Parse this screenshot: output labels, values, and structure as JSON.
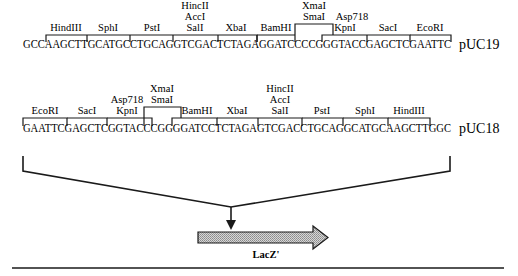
{
  "diagram": {
    "type": "plasmid polylinker / multiple cloning site map",
    "top": {
      "plasmid": "pUC19",
      "sequence": "GCCAAGCTTGCATGCCTGCAGGTCGACTCTAGAGGATCCCCGGGTACCGAGCTCGAATTC",
      "sites": [
        {
          "name": "HindIII"
        },
        {
          "name": "SphI"
        },
        {
          "name": "PstI"
        },
        {
          "name": "HincII / AccI / SalI",
          "lines": [
            "HincII",
            "AccI",
            "SalI"
          ]
        },
        {
          "name": "XbaI"
        },
        {
          "name": "BamHI"
        },
        {
          "name": "XmaI / SmaI",
          "lines": [
            "XmaI",
            "SmaI"
          ]
        },
        {
          "name": "Asp718 / KpnI",
          "lines": [
            "Asp718",
            "KpnI"
          ]
        },
        {
          "name": "SacI"
        },
        {
          "name": "EcoRI"
        }
      ]
    },
    "bottom": {
      "plasmid": "pUC18",
      "sequence": "GAATTCGAGCTCGGTACCCGGGGATCCTCTAGAGTCGACCTGCAGGCATGCAAGCTTGGC",
      "sites": [
        {
          "name": "EcoRI"
        },
        {
          "name": "SacI"
        },
        {
          "name": "Asp718 / KpnI",
          "lines": [
            "Asp718",
            "KpnI"
          ]
        },
        {
          "name": "XmaI / SmaI",
          "lines": [
            "XmaI",
            "SmaI"
          ]
        },
        {
          "name": "BamHI"
        },
        {
          "name": "XbaI"
        },
        {
          "name": "HincII / AccI / SalI",
          "lines": [
            "HincII",
            "AccI",
            "SalI"
          ]
        },
        {
          "name": "PstI"
        },
        {
          "name": "SphI"
        },
        {
          "name": "HindIII"
        }
      ]
    },
    "gene": {
      "label": "LacZ'"
    }
  },
  "t": {
    "top_seq": "GCCAAGCTTGCATGCCTGCAGGTCGACTCTAGAGGATCCCCGGGTACCGAGCTCGAATTC",
    "top_plasmid": "pUC19",
    "bot_seq": "GAATTCGAGCTCGGTACCCGGGGATCCTCTAGAGTCGACCTGCAGGCATGCAAGCTTGGC",
    "bot_plasmid": "pUC18",
    "HindIII": "HindIII",
    "SphI": "SphI",
    "PstI": "PstI",
    "HincII": "HincII",
    "AccI": "AccI",
    "SalI": "SalI",
    "XbaI": "XbaI",
    "BamHI": "BamHI",
    "XmaI": "XmaI",
    "SmaI": "SmaI",
    "Asp718": "Asp718",
    "KpnI": "KpnI",
    "SacI": "SacI",
    "EcoRI": "EcoRI",
    "lacz": "LacZ'"
  },
  "colors": {
    "ink": "#1a1a1a",
    "arrow_fill": "#b8b8b8",
    "background": "#ffffff"
  }
}
